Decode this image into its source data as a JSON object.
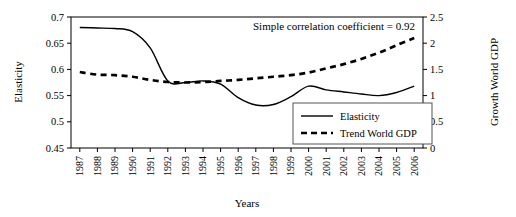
{
  "chart_data": {
    "type": "line",
    "title": "",
    "xlabel": "Years",
    "ylabel": "Elasticity",
    "y2label": "Growth World GDP",
    "categories": [
      "1987",
      "1988",
      "1989",
      "1990",
      "1991",
      "1992",
      "1993",
      "1994",
      "1995",
      "1996",
      "1997",
      "1998",
      "1999",
      "2000",
      "2001",
      "2002",
      "2003",
      "2004",
      "2005",
      "2006"
    ],
    "ylim": [
      0.45,
      0.7
    ],
    "yticks": [
      "0.45",
      "0.5",
      "0.55",
      "0.6",
      "0.65",
      "0.7"
    ],
    "ytick_values": [
      0.45,
      0.5,
      0.55,
      0.6,
      0.65,
      0.7
    ],
    "y2lim": [
      0,
      2.5
    ],
    "y2ticks": [
      "0",
      "0.5",
      "1",
      "1.5",
      "2",
      "2.5"
    ],
    "y2tick_values": [
      0,
      0.5,
      1,
      1.5,
      2,
      2.5
    ],
    "grid": false,
    "legend_position": "bottom-right",
    "annotation": "Simple correlation coefficient = 0.92",
    "correlation": 0.92,
    "series": [
      {
        "name": "Elasticity",
        "axis": "left",
        "style": "solid",
        "values": [
          0.68,
          0.679,
          0.678,
          0.672,
          0.641,
          0.578,
          0.575,
          0.578,
          0.572,
          0.546,
          0.532,
          0.533,
          0.548,
          0.568,
          0.561,
          0.557,
          0.553,
          0.55,
          0.556,
          0.568
        ]
      },
      {
        "name": "Trend World GDP",
        "axis": "right",
        "style": "dashed",
        "values": [
          1.45,
          1.4,
          1.39,
          1.36,
          1.3,
          1.26,
          1.25,
          1.26,
          1.28,
          1.3,
          1.33,
          1.36,
          1.39,
          1.44,
          1.52,
          1.6,
          1.7,
          1.82,
          1.96,
          2.1
        ],
        "values_left_scale": [
          0.59,
          0.588,
          0.588,
          0.587,
          0.585,
          0.583,
          0.582,
          0.583,
          0.583,
          0.584,
          0.585,
          0.586,
          0.587,
          0.589,
          0.592,
          0.595,
          0.6,
          0.605,
          0.612,
          0.62
        ]
      }
    ]
  },
  "legend": {
    "items": [
      {
        "label": "Elasticity",
        "style": "solid"
      },
      {
        "label": "Trend World GDP",
        "style": "dashed"
      }
    ]
  },
  "colors": {
    "line": "#000000",
    "axis": "#000000",
    "background": "#ffffff"
  }
}
